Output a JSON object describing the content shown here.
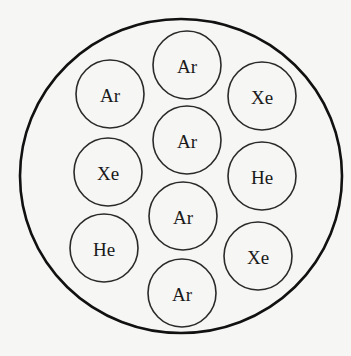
{
  "diagram": {
    "type": "gas-mixture-container",
    "container": {
      "cx": 181,
      "cy": 176,
      "rx": 161,
      "ry": 157
    },
    "atom_radius": 34,
    "atoms": [
      {
        "label": "Ar",
        "cx": 187,
        "cy": 65
      },
      {
        "label": "Ar",
        "cx": 110,
        "cy": 94
      },
      {
        "label": "Xe",
        "cx": 262,
        "cy": 96
      },
      {
        "label": "Ar",
        "cx": 187,
        "cy": 140
      },
      {
        "label": "Xe",
        "cx": 108,
        "cy": 172
      },
      {
        "label": "He",
        "cx": 262,
        "cy": 176
      },
      {
        "label": "Ar",
        "cx": 183,
        "cy": 216
      },
      {
        "label": "He",
        "cx": 104,
        "cy": 248
      },
      {
        "label": "Xe",
        "cx": 258,
        "cy": 256
      },
      {
        "label": "Ar",
        "cx": 182,
        "cy": 293
      }
    ],
    "counts": {
      "Ar": 5,
      "Xe": 3,
      "He": 2
    },
    "colors": {
      "stroke": "#2a2a2a",
      "background": "#f6f6f4",
      "text": "#1a1a1a"
    }
  }
}
